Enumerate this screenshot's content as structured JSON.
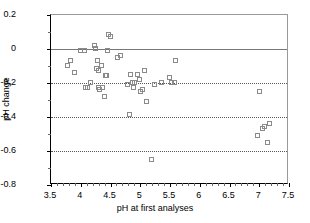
{
  "chart_data": {
    "type": "scatter",
    "title": "",
    "xlabel": "pH at first analyses",
    "ylabel": "pH change",
    "xlim": [
      3.5,
      7.5
    ],
    "ylim": [
      -0.8,
      0.2
    ],
    "xticks": [
      "3.5",
      "4",
      "4.5",
      "5",
      "5.5",
      "6",
      "6.5",
      "7",
      "7.5"
    ],
    "xtick_values": [
      3.5,
      4,
      4.5,
      5,
      5.5,
      6,
      6.5,
      7,
      7.5
    ],
    "yticks": [
      "0.2",
      "0",
      "-0.2",
      "-0.4",
      "-0.6",
      "-0.8"
    ],
    "ytick_values": [
      0.2,
      0,
      -0.2,
      -0.4,
      -0.6,
      -0.8
    ],
    "grid": "horizontal dotted at -0.2, -0.4, -0.6; solid reference line at 0",
    "gridline_values": [
      -0.2,
      -0.4,
      -0.6
    ],
    "reference_line": 0,
    "legend": "none",
    "marker": "open square",
    "series": [
      {
        "name": "pH change vs initial pH",
        "points": [
          [
            3.78,
            -0.1
          ],
          [
            3.84,
            -0.07
          ],
          [
            3.9,
            -0.14
          ],
          [
            4.0,
            -0.01
          ],
          [
            4.07,
            -0.01
          ],
          [
            4.09,
            -0.23
          ],
          [
            4.12,
            -0.23
          ],
          [
            4.18,
            -0.2
          ],
          [
            4.24,
            0.02
          ],
          [
            4.26,
            -0.0
          ],
          [
            4.27,
            -0.12
          ],
          [
            4.29,
            -0.07
          ],
          [
            4.3,
            -0.13
          ],
          [
            4.31,
            -0.23
          ],
          [
            4.33,
            -0.24
          ],
          [
            4.35,
            -0.1
          ],
          [
            4.38,
            -0.23
          ],
          [
            4.4,
            -0.28
          ],
          [
            4.42,
            -0.16
          ],
          [
            4.44,
            -0.16
          ],
          [
            4.46,
            -0.01
          ],
          [
            4.48,
            0.08
          ],
          [
            4.5,
            0.07
          ],
          [
            4.63,
            -0.05
          ],
          [
            4.68,
            -0.04
          ],
          [
            4.8,
            -0.21
          ],
          [
            4.82,
            -0.39
          ],
          [
            4.84,
            -0.15
          ],
          [
            4.88,
            -0.2
          ],
          [
            4.9,
            -0.23
          ],
          [
            4.92,
            -0.2
          ],
          [
            4.96,
            -0.15
          ],
          [
            4.99,
            -0.18
          ],
          [
            5.02,
            -0.25
          ],
          [
            5.05,
            -0.24
          ],
          [
            5.08,
            -0.13
          ],
          [
            5.12,
            -0.31
          ],
          [
            5.2,
            -0.65
          ],
          [
            5.24,
            -0.21
          ],
          [
            5.36,
            -0.2
          ],
          [
            5.5,
            -0.17
          ],
          [
            5.54,
            -0.2
          ],
          [
            5.58,
            -0.2
          ],
          [
            5.6,
            -0.07
          ],
          [
            6.98,
            -0.51
          ],
          [
            7.02,
            -0.25
          ],
          [
            7.06,
            -0.47
          ],
          [
            7.1,
            -0.46
          ],
          [
            7.14,
            -0.55
          ],
          [
            7.18,
            -0.44
          ]
        ]
      }
    ]
  }
}
